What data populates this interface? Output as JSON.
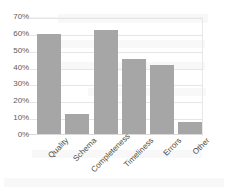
{
  "chart_data": {
    "type": "bar",
    "title": "",
    "subtitle": "",
    "xlabel": "",
    "ylabel": "",
    "categories": [
      "Quality",
      "Schema",
      "Completeness",
      "Timeliness",
      "Errors",
      "Other"
    ],
    "values": [
      60,
      12,
      62,
      45,
      41,
      7
    ],
    "series": [
      {
        "name": "",
        "values": [
          60,
          12,
          62,
          45,
          41,
          7
        ]
      }
    ],
    "ylim": [
      0,
      70
    ],
    "ytick_values": [
      0,
      10,
      20,
      30,
      40,
      50,
      60,
      70
    ],
    "ytick_labels": [
      "0%",
      "10%",
      "20%",
      "30%",
      "40%",
      "50%",
      "60%",
      "70%"
    ],
    "grid": true,
    "grid_axis": "y",
    "legend": false,
    "legend_position": "none",
    "annotations": [],
    "bar_color": "#a6a6a6",
    "grid_color": "#e6e6e6",
    "axis_text_color": "#4a4a4a",
    "background_color": "#ffffff",
    "xtick_label_rotation": -45
  }
}
